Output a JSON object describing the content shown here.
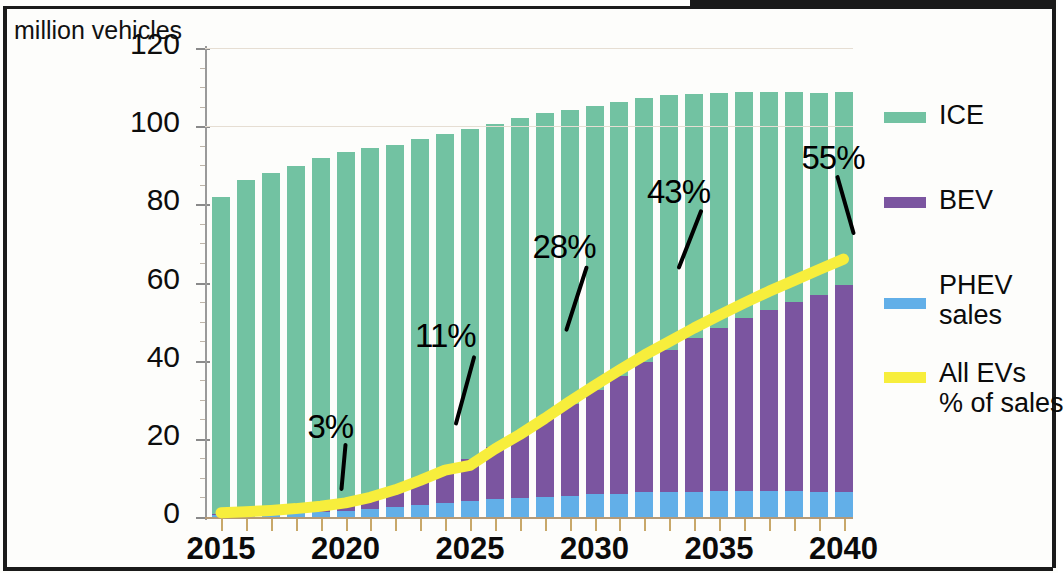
{
  "title": "million vehicles",
  "legend": [
    {
      "label": "ICE",
      "color": "#72c2a2",
      "key": "ice"
    },
    {
      "label": "BEV",
      "color": "#7b55a0",
      "key": "bev"
    },
    {
      "label": "PHEV\nsales",
      "color": "#62afe8",
      "key": "phev"
    },
    {
      "label": "All EVs\n% of sales",
      "color": "#f7ee3c",
      "key": "evline"
    }
  ],
  "legend_lines": {
    "ice": [
      "ICE"
    ],
    "bev": [
      "BEV"
    ],
    "phev": [
      "PHEV",
      "sales"
    ],
    "evline": [
      "All EVs",
      "% of sales"
    ]
  },
  "chart_data": {
    "type": "bar",
    "title": "million vehicles",
    "xlabel": "",
    "ylabel": "million vehicles",
    "ylim": [
      0,
      120
    ],
    "yticks": [
      0,
      20,
      40,
      60,
      80,
      100,
      120
    ],
    "xticks_labeled": [
      "2015",
      "2020",
      "2025",
      "2030",
      "2035",
      "2040"
    ],
    "grid": false,
    "legend_position": "right",
    "stacked": true,
    "categories": [
      "2015",
      "2016",
      "2017",
      "2018",
      "2019",
      "2020",
      "2021",
      "2022",
      "2023",
      "2024",
      "2025",
      "2026",
      "2027",
      "2028",
      "2029",
      "2030",
      "2031",
      "2032",
      "2033",
      "2034",
      "2035",
      "2036",
      "2037",
      "2038",
      "2039",
      "2040"
    ],
    "series": [
      {
        "name": "PHEV sales",
        "color": "#62afe8",
        "values": [
          0.4,
          0.5,
          0.7,
          0.9,
          1.2,
          1.6,
          2.1,
          2.6,
          3.1,
          3.6,
          4.1,
          4.5,
          4.9,
          5.2,
          5.5,
          5.8,
          6.0,
          6.3,
          6.4,
          6.5,
          6.6,
          6.6,
          6.6,
          6.6,
          6.5,
          6.4
        ]
      },
      {
        "name": "BEV",
        "color": "#7b55a0",
        "values": [
          0.3,
          0.5,
          0.8,
          1.1,
          1.6,
          2.2,
          3.2,
          4.6,
          6.3,
          8.4,
          10.8,
          13.5,
          16.5,
          19.8,
          23.3,
          26.8,
          30.2,
          33.4,
          36.4,
          39.2,
          41.8,
          44.2,
          46.4,
          48.4,
          50.3,
          52.9
        ]
      },
      {
        "name": "ICE",
        "color": "#72c2a2",
        "values": [
          81.3,
          85.2,
          86.5,
          87.7,
          89.1,
          89.6,
          89.2,
          88.1,
          87.4,
          86.0,
          84.3,
          82.6,
          80.8,
          78.4,
          75.4,
          72.5,
          70.1,
          67.6,
          65.1,
          62.6,
          60.1,
          57.9,
          55.7,
          53.7,
          51.8,
          49.4
        ]
      }
    ],
    "totals": [
      82,
      86.2,
      88,
      89.7,
      91.9,
      93.4,
      94.5,
      95.3,
      96.8,
      98,
      99.2,
      100.6,
      102.2,
      103.4,
      104.2,
      105.1,
      106.3,
      107.3,
      107.9,
      108.3,
      108.5,
      108.7,
      108.7,
      108.7,
      108.6,
      108.7
    ],
    "overlay_line": {
      "name": "All EVs % of sales",
      "color": "#f7ee3c",
      "axis": "secondary",
      "unit": "%",
      "values": [
        0.9,
        1.1,
        1.4,
        1.8,
        2.3,
        3.0,
        4.2,
        5.8,
        7.8,
        10.0,
        11.0,
        14.5,
        17.6,
        21.0,
        24.6,
        28.0,
        31.3,
        34.5,
        37.4,
        40.3,
        43.0,
        45.6,
        48.1,
        50.4,
        52.7,
        55.0
      ]
    },
    "annotations": [
      {
        "text": "3%",
        "year": "2020",
        "value": 3
      },
      {
        "text": "11%",
        "year": "2025",
        "value": 11
      },
      {
        "text": "28%",
        "year": "2030",
        "value": 28
      },
      {
        "text": "43%",
        "year": "2035",
        "value": 43
      },
      {
        "text": "55%",
        "year": "2040",
        "value": 55
      }
    ]
  }
}
